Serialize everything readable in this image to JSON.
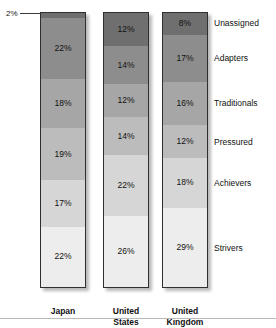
{
  "chart_data": {
    "type": "bar",
    "subtype": "stacked-bar-100",
    "title": "",
    "xlabel": "",
    "ylabel": "",
    "ylim": [
      0,
      100
    ],
    "grid": false,
    "legend_position": "right",
    "categories": [
      "Japan",
      "United States",
      "United Kingdom"
    ],
    "series": [
      {
        "name": "Unassigned",
        "values": [
          2,
          12,
          8
        ]
      },
      {
        "name": "Adapters",
        "values": [
          22,
          14,
          17
        ]
      },
      {
        "name": "Traditionals",
        "values": [
          18,
          12,
          16
        ]
      },
      {
        "name": "Pressured",
        "values": [
          19,
          14,
          12
        ]
      },
      {
        "name": "Achievers",
        "values": [
          17,
          22,
          18
        ]
      },
      {
        "name": "Strivers",
        "values": [
          22,
          26,
          29
        ]
      }
    ],
    "value_suffix": "%",
    "annotations": [
      {
        "text": "2%",
        "target": "Japan / Unassigned",
        "kind": "leader-line-callout"
      }
    ]
  },
  "colors": {
    "unassigned": "#6f6f6f",
    "adapters": "#8d8d8d",
    "traditionals": "#a6a6a6",
    "pressured": "#bcbcbc",
    "achievers": "#d6d6d6",
    "strivers": "#ededed",
    "bar_border": "#2f2f2f",
    "text": "#111111",
    "rule": "#b9b9b9"
  },
  "bars": [
    {
      "country": "Japan",
      "country_line1": "Japan",
      "country_line2": "",
      "segments": [
        {
          "name": "Unassigned",
          "label": "2%",
          "value": 2,
          "show_label": false
        },
        {
          "name": "Adapters",
          "label": "22%",
          "value": 22,
          "show_label": true
        },
        {
          "name": "Traditionals",
          "label": "18%",
          "value": 18,
          "show_label": true
        },
        {
          "name": "Pressured",
          "label": "19%",
          "value": 19,
          "show_label": true
        },
        {
          "name": "Achievers",
          "label": "17%",
          "value": 17,
          "show_label": true
        },
        {
          "name": "Strivers",
          "label": "22%",
          "value": 22,
          "show_label": true
        }
      ]
    },
    {
      "country": "United States",
      "country_line1": "United",
      "country_line2": "States",
      "segments": [
        {
          "name": "Unassigned",
          "label": "12%",
          "value": 12,
          "show_label": true
        },
        {
          "name": "Adapters",
          "label": "14%",
          "value": 14,
          "show_label": true
        },
        {
          "name": "Traditionals",
          "label": "12%",
          "value": 12,
          "show_label": true
        },
        {
          "name": "Pressured",
          "label": "14%",
          "value": 14,
          "show_label": true
        },
        {
          "name": "Achievers",
          "label": "22%",
          "value": 22,
          "show_label": true
        },
        {
          "name": "Strivers",
          "label": "26%",
          "value": 26,
          "show_label": true
        }
      ]
    },
    {
      "country": "United Kingdom",
      "country_line1": "United",
      "country_line2": "Kingdom",
      "segments": [
        {
          "name": "Unassigned",
          "label": "8%",
          "value": 8,
          "show_label": true
        },
        {
          "name": "Adapters",
          "label": "17%",
          "value": 17,
          "show_label": true
        },
        {
          "name": "Traditionals",
          "label": "16%",
          "value": 16,
          "show_label": true
        },
        {
          "name": "Pressured",
          "label": "12%",
          "value": 12,
          "show_label": true
        },
        {
          "name": "Achievers",
          "label": "18%",
          "value": 18,
          "show_label": true
        },
        {
          "name": "Strivers",
          "label": "29%",
          "value": 29,
          "show_label": true
        }
      ]
    }
  ],
  "legend": {
    "items": [
      {
        "label": "Unassigned"
      },
      {
        "label": "Adapters"
      },
      {
        "label": "Traditionals"
      },
      {
        "label": "Pressured"
      },
      {
        "label": "Achievers"
      },
      {
        "label": "Strivers"
      }
    ]
  },
  "callout": {
    "text": "2%"
  }
}
